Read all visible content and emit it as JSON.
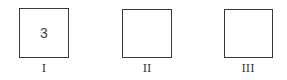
{
  "boxes": [
    {
      "label": "I",
      "value": "3"
    },
    {
      "label": "II",
      "value": ""
    },
    {
      "label": "III",
      "value": ""
    }
  ]
}
